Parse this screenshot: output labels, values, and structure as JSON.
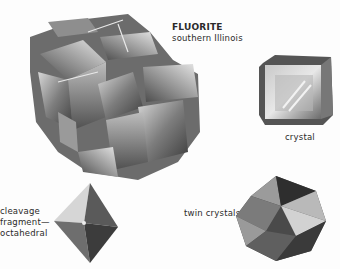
{
  "page": {
    "background": "#fdfdfd"
  },
  "specimen": {
    "name": "FLUORITE",
    "locality": "southern Illinois",
    "icon": "fluorite-cluster-illustration"
  },
  "crystal": {
    "label": "crystal",
    "icon": "cube-crystal-illustration"
  },
  "cleavage": {
    "lines": [
      "cleavage",
      "fragment—",
      "octahedral"
    ],
    "icon": "octahedron-illustration"
  },
  "twin": {
    "label": "twin crystals",
    "icon": "twin-crystals-illustration"
  },
  "colors": {
    "text": "#2a2a2a",
    "dark_gray": "#3a3a3a",
    "mid_gray": "#7a7a7a",
    "light_gray": "#c8c8c8"
  }
}
